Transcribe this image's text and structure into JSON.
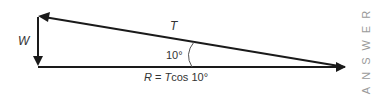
{
  "diagram": {
    "labels": {
      "tension": "T",
      "weight": "W",
      "angle": "10°",
      "resultant_prefix": "R",
      "resultant_eq": " = ",
      "resultant_t": "T",
      "resultant_rest": "cos 10°"
    },
    "side_label": "ANSWER",
    "colors": {
      "line": "#1a1a1a",
      "text": "#333333",
      "side_label": "#9a9a9a"
    }
  }
}
